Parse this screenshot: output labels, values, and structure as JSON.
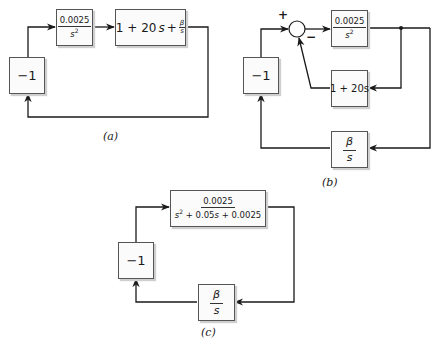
{
  "diagrams": {
    "a": {
      "caption": "(a)",
      "blocks": {
        "gain": "−1",
        "plant": {
          "num": "0.0025",
          "den": "s",
          "den_exp": "2"
        },
        "controller": {
          "term1": "1 + 20",
          "s": "s",
          "plus": "+",
          "beta_num": "β",
          "beta_den": "s"
        }
      }
    },
    "b": {
      "caption": "(b)",
      "summing_junction": {
        "plus": "+",
        "minus": "−"
      },
      "blocks": {
        "gain": "−1",
        "plant": {
          "num": "0.0025",
          "den": "s",
          "den_exp": "2"
        },
        "feedback": "1 + 20s",
        "integral": {
          "num": "β",
          "den": "s"
        }
      }
    },
    "c": {
      "caption": "(c)",
      "blocks": {
        "gain": "−1",
        "closed_loop": {
          "num": "0.0025",
          "den_pre": "s",
          "den_exp": "2",
          "den_rest": " + 0.05",
          "den_s": "s",
          "den_tail": " + 0.0025"
        },
        "integral": {
          "num": "β",
          "den": "s"
        }
      }
    }
  },
  "colors": {
    "line": "#1a1a1a",
    "block_border": "#555555",
    "block_fill": "#fbfbfb",
    "shadow": "#cfcfcf"
  }
}
